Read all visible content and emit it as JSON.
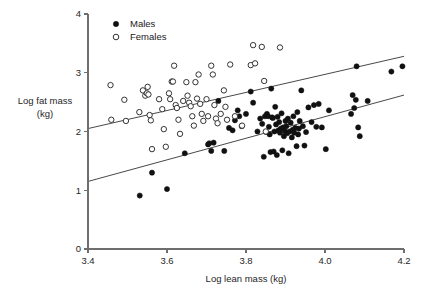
{
  "chart_data": {
    "type": "scatter",
    "title": "",
    "xlabel": "Log lean mass (kg)",
    "ylabel": "Log fat mass (kg)",
    "ylabel_line1": "Log fat mass",
    "ylabel_line2": "(kg)",
    "xlim": [
      3.4,
      4.2
    ],
    "ylim": [
      0,
      4
    ],
    "xticks": [
      "3.4",
      "3.6",
      "3.8",
      "4.0",
      "4.2"
    ],
    "xtick_values": [
      3.4,
      3.6,
      3.8,
      4.0,
      4.2
    ],
    "yticks": [
      "0",
      "1",
      "2",
      "3",
      "4"
    ],
    "ytick_values": [
      0,
      1,
      2,
      3,
      4
    ],
    "grid": false,
    "legend_position": "top-left",
    "legend": [
      {
        "name": "Males",
        "marker": "filled-circle",
        "color": "#111111"
      },
      {
        "name": "Females",
        "marker": "open-circle",
        "color": "#ffffff"
      }
    ],
    "series": [
      {
        "name": "Males",
        "marker": "filled-circle",
        "points": [
          [
            3.531,
            0.91
          ],
          [
            3.562,
            1.3
          ],
          [
            3.6,
            1.02
          ],
          [
            3.645,
            1.63
          ],
          [
            3.704,
            1.78
          ],
          [
            3.707,
            1.8
          ],
          [
            3.712,
            1.67
          ],
          [
            3.718,
            1.81
          ],
          [
            3.73,
            2.52
          ],
          [
            3.745,
            1.67
          ],
          [
            3.757,
            2.06
          ],
          [
            3.766,
            2.02
          ],
          [
            3.772,
            2.19
          ],
          [
            3.779,
            2.36
          ],
          [
            3.783,
            2.26
          ],
          [
            3.789,
            2.09
          ],
          [
            3.8,
            2.3
          ],
          [
            3.812,
            2.68
          ],
          [
            3.818,
            2.49
          ],
          [
            3.829,
            2.0
          ],
          [
            3.836,
            2.22
          ],
          [
            3.841,
            2.13
          ],
          [
            3.845,
            1.57
          ],
          [
            3.848,
            2.26
          ],
          [
            3.851,
            1.99
          ],
          [
            3.853,
            2.3
          ],
          [
            3.856,
            2.26
          ],
          [
            3.858,
            2.08
          ],
          [
            3.86,
            1.95
          ],
          [
            3.862,
            1.65
          ],
          [
            3.864,
            2.73
          ],
          [
            3.866,
            2.24
          ],
          [
            3.868,
            2.23
          ],
          [
            3.87,
            1.66
          ],
          [
            3.872,
            2.0
          ],
          [
            3.874,
            2.42
          ],
          [
            3.876,
            2.12
          ],
          [
            3.878,
            1.6
          ],
          [
            3.88,
            2.25
          ],
          [
            3.882,
            2.02
          ],
          [
            3.884,
            2.16
          ],
          [
            3.886,
            1.98
          ],
          [
            3.888,
            2.05
          ],
          [
            3.89,
            2.31
          ],
          [
            3.892,
            1.68
          ],
          [
            3.894,
            2.07
          ],
          [
            3.896,
            1.92
          ],
          [
            3.898,
            2.01
          ],
          [
            3.9,
            2.18
          ],
          [
            3.902,
            2.09
          ],
          [
            3.904,
            1.97
          ],
          [
            3.906,
            2.22
          ],
          [
            3.908,
            1.63
          ],
          [
            3.91,
            2.0
          ],
          [
            3.913,
            2.15
          ],
          [
            3.916,
            1.9
          ],
          [
            3.918,
            2.03
          ],
          [
            3.92,
            2.26
          ],
          [
            3.922,
            1.98
          ],
          [
            3.925,
            2.06
          ],
          [
            3.928,
            1.75
          ],
          [
            3.93,
            2.33
          ],
          [
            3.932,
            1.95
          ],
          [
            3.934,
            2.05
          ],
          [
            3.936,
            2.18
          ],
          [
            3.94,
            2.7
          ],
          [
            3.944,
            2.09
          ],
          [
            3.948,
            1.76
          ],
          [
            3.952,
            1.99
          ],
          [
            3.958,
            2.41
          ],
          [
            3.966,
            2.16
          ],
          [
            3.972,
            2.45
          ],
          [
            3.978,
            2.08
          ],
          [
            3.984,
            2.47
          ],
          [
            3.992,
            2.07
          ],
          [
            4.002,
            1.7
          ],
          [
            4.01,
            2.36
          ],
          [
            4.066,
            2.3
          ],
          [
            4.07,
            2.62
          ],
          [
            4.074,
            2.4
          ],
          [
            4.078,
            2.54
          ],
          [
            4.08,
            3.11
          ],
          [
            4.084,
            2.07
          ],
          [
            4.088,
            1.92
          ],
          [
            4.108,
            2.52
          ],
          [
            4.168,
            3.02
          ],
          [
            4.196,
            3.11
          ]
        ]
      },
      {
        "name": "Females",
        "marker": "open-circle",
        "points": [
          [
            3.457,
            2.79
          ],
          [
            3.459,
            2.2
          ],
          [
            3.492,
            2.54
          ],
          [
            3.496,
            2.18
          ],
          [
            3.53,
            2.33
          ],
          [
            3.539,
            2.7
          ],
          [
            3.545,
            2.61
          ],
          [
            3.549,
            2.65
          ],
          [
            3.551,
            2.76
          ],
          [
            3.553,
            2.63
          ],
          [
            3.556,
            2.28
          ],
          [
            3.559,
            2.19
          ],
          [
            3.562,
            1.7
          ],
          [
            3.58,
            2.55
          ],
          [
            3.588,
            2.38
          ],
          [
            3.592,
            2.04
          ],
          [
            3.597,
            1.74
          ],
          [
            3.605,
            2.65
          ],
          [
            3.608,
            2.55
          ],
          [
            3.612,
            2.85
          ],
          [
            3.615,
            2.85
          ],
          [
            3.618,
            3.12
          ],
          [
            3.622,
            2.45
          ],
          [
            3.625,
            2.4
          ],
          [
            3.629,
            2.2
          ],
          [
            3.633,
            1.96
          ],
          [
            3.641,
            2.52
          ],
          [
            3.649,
            2.84
          ],
          [
            3.652,
            2.61
          ],
          [
            3.656,
            2.49
          ],
          [
            3.66,
            2.43
          ],
          [
            3.664,
            2.26
          ],
          [
            3.668,
            2.1
          ],
          [
            3.672,
            2.84
          ],
          [
            3.676,
            2.56
          ],
          [
            3.68,
            2.97
          ],
          [
            3.684,
            2.47
          ],
          [
            3.688,
            2.3
          ],
          [
            3.692,
            2.18
          ],
          [
            3.7,
            2.55
          ],
          [
            3.704,
            2.26
          ],
          [
            3.712,
            3.12
          ],
          [
            3.716,
            2.97
          ],
          [
            3.72,
            2.45
          ],
          [
            3.724,
            2.22
          ],
          [
            3.728,
            2.14
          ],
          [
            3.736,
            2.3
          ],
          [
            3.744,
            2.7
          ],
          [
            3.748,
            2.42
          ],
          [
            3.752,
            2.2
          ],
          [
            3.76,
            3.14
          ],
          [
            3.772,
            2.26
          ],
          [
            3.79,
            2.1
          ],
          [
            3.812,
            3.13
          ],
          [
            3.818,
            3.47
          ],
          [
            3.823,
            3.16
          ],
          [
            3.84,
            3.44
          ],
          [
            3.846,
            2.86
          ],
          [
            3.85,
            2.0
          ],
          [
            3.886,
            3.43
          ]
        ]
      }
    ],
    "fit_lines": [
      {
        "name": "Females fit",
        "x0": 3.4,
        "y0": 2.05,
        "x1": 4.2,
        "y1": 3.28
      },
      {
        "name": "Males fit",
        "x0": 3.4,
        "y0": 1.15,
        "x1": 4.2,
        "y1": 2.62
      }
    ]
  }
}
